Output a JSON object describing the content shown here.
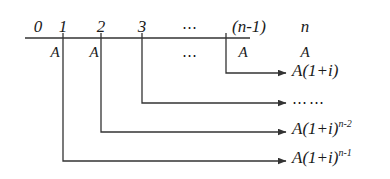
{
  "figure": {
    "name": "compound-interest-annuity-timeline",
    "stroke_color": "#333333",
    "text_color": "#1a1a1a",
    "background": "#ffffff"
  },
  "axis": {
    "label": "timeline-axis",
    "x_start": 25,
    "x_end": 250,
    "y": 38
  },
  "periods": [
    {
      "key": "p0",
      "label": "0",
      "x": 38,
      "italic": true,
      "tick": false
    },
    {
      "key": "p1",
      "label": "1",
      "x": 75,
      "italic": true,
      "tick": true
    },
    {
      "key": "p2",
      "label": "2",
      "x": 115,
      "italic": true,
      "tick": true
    },
    {
      "key": "p3",
      "label": "3",
      "x": 155,
      "italic": true,
      "tick": true
    },
    {
      "key": "pdots",
      "label": "⋯",
      "x": 194,
      "italic": false,
      "tick": false
    },
    {
      "key": "pn1",
      "label": "(n-1)",
      "x": 250,
      "italic": true,
      "tick": true
    },
    {
      "key": "pn",
      "label": "n",
      "x": 305,
      "italic": true,
      "tick": false
    }
  ],
  "payments": [
    {
      "key": "a1",
      "label": "A",
      "x": 57,
      "y": 48
    },
    {
      "key": "a2",
      "label": "A",
      "x": 98,
      "y": 48
    },
    {
      "key": "adots",
      "label": "⋯",
      "x": 194,
      "y": 50
    },
    {
      "key": "an1",
      "label": "A",
      "x": 248,
      "y": 48
    },
    {
      "key": "an",
      "label": "A",
      "x": 305,
      "y": 48
    }
  ],
  "flows": [
    {
      "key": "flow-n-minus-1",
      "from_period": "(n-1)",
      "drop_x": 226,
      "drop_from_y": 38,
      "drop_to_y": 73,
      "arrow_to_x": 286,
      "result_x": 292,
      "result_y": 62,
      "result_kind": "power",
      "result_text": "A(1+i)",
      "result_exponent": "",
      "result_plain": "A(1+i)"
    },
    {
      "key": "flow-ellipsis",
      "from_period": "3",
      "drop_x": 142,
      "drop_from_y": 38,
      "drop_to_y": 103,
      "arrow_to_x": 286,
      "result_x": 292,
      "result_y": 92,
      "result_kind": "dots",
      "result_text": "⋯⋯",
      "result_exponent": "",
      "result_plain": "⋯⋯"
    },
    {
      "key": "flow-n-minus-2",
      "from_period": "2",
      "drop_x": 101,
      "drop_from_y": 38,
      "drop_to_y": 132,
      "arrow_to_x": 286,
      "result_x": 292,
      "result_y": 120,
      "result_kind": "power",
      "result_text": "A(1+i)",
      "result_exponent": "n-2",
      "result_plain": "A(1+i)^(n-2)"
    },
    {
      "key": "flow-n-minus-1-power",
      "from_period": "1",
      "drop_x": 63,
      "drop_from_y": 38,
      "drop_to_y": 161,
      "arrow_to_x": 286,
      "result_x": 292,
      "result_y": 149,
      "result_kind": "power",
      "result_text": "A(1+i)",
      "result_exponent": "n-1",
      "result_plain": "A(1+i)^(n-1)"
    }
  ]
}
